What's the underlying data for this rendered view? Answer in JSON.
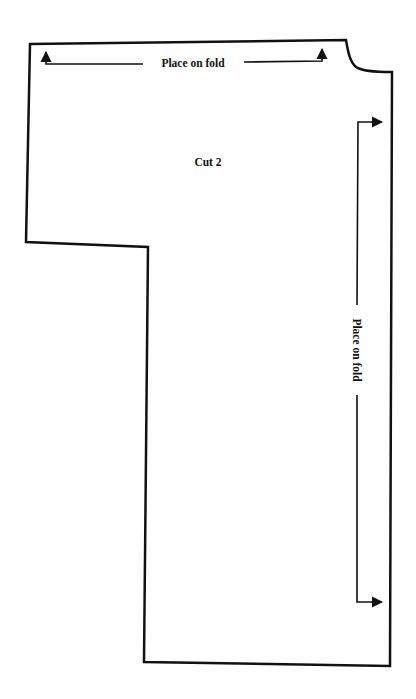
{
  "pattern": {
    "piece_label": "Cut 2",
    "top_fold_label": "Place on fold",
    "side_fold_label": "Place on fold"
  },
  "colors": {
    "background": "#ffffff",
    "line": "#111111"
  }
}
